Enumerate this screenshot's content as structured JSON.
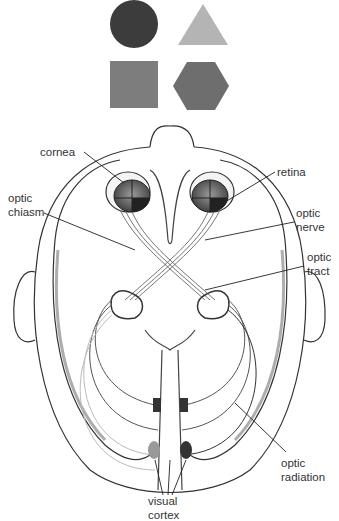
{
  "shapes": [
    {
      "name": "circle",
      "color": "#3c3c3c"
    },
    {
      "name": "triangle",
      "color": "#b4b4b4"
    },
    {
      "name": "square",
      "color": "#7d7d7d"
    },
    {
      "name": "hexagon",
      "color": "#6e6e6e"
    }
  ],
  "labels": {
    "cornea": "cornea",
    "optic_chiasm": [
      "optic",
      "chiasm"
    ],
    "retina": "retina",
    "optic_nerve": [
      "optic",
      "nerve"
    ],
    "optic_tract": [
      "optic",
      "tract"
    ],
    "optic_radiation": [
      "optic",
      "radiation"
    ],
    "visual_cortex": [
      "visual",
      "cortex"
    ]
  }
}
